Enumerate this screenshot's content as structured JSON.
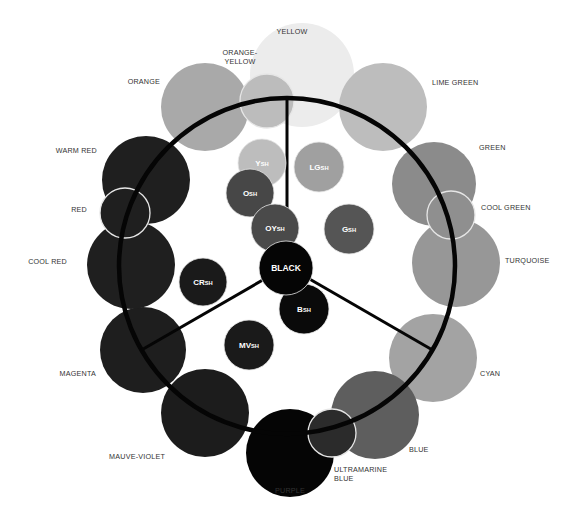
{
  "outer_colors": [
    {
      "id": "yellow",
      "label_lines": [
        "YELLOW"
      ],
      "fill": "#ececec",
      "outlined": false
    },
    {
      "id": "lime-green",
      "label_lines": [
        "LIME GREEN"
      ],
      "fill": "#bdbdbd",
      "outlined": false
    },
    {
      "id": "orange",
      "label_lines": [
        "ORANGE"
      ],
      "fill": "#a9a9a9",
      "outlined": false
    },
    {
      "id": "orange-yellow",
      "label_lines": [
        "ORANGE-",
        "YELLOW"
      ],
      "fill": "#bcbcbc",
      "outlined": true
    },
    {
      "id": "green",
      "label_lines": [
        "GREEN"
      ],
      "fill": "#8b8b8b",
      "outlined": false
    },
    {
      "id": "turquoise",
      "label_lines": [
        "TURQUOISE"
      ],
      "fill": "#979797",
      "outlined": false
    },
    {
      "id": "cool-green",
      "label_lines": [
        "COOL GREEN"
      ],
      "fill": "#8f8f8f",
      "outlined": true
    },
    {
      "id": "cyan",
      "label_lines": [
        "CYAN"
      ],
      "fill": "#a3a3a3",
      "outlined": false
    },
    {
      "id": "blue",
      "label_lines": [
        "BLUE"
      ],
      "fill": "#5e5e5e",
      "outlined": false
    },
    {
      "id": "purple",
      "label_lines": [
        "PURPLE"
      ],
      "fill": "#050505",
      "outlined": false
    },
    {
      "id": "ultramarine-blue",
      "label_lines": [
        "ULTRAMARINE",
        "BLUE"
      ],
      "fill": "#2b2b2b",
      "outlined": true
    },
    {
      "id": "mauve-violet",
      "label_lines": [
        "MAUVE-VIOLET"
      ],
      "fill": "#1c1c1c",
      "outlined": false
    },
    {
      "id": "magenta",
      "label_lines": [
        "MAGENTA"
      ],
      "fill": "#1e1e1e",
      "outlined": false
    },
    {
      "id": "warm-red",
      "label_lines": [
        "WARM RED"
      ],
      "fill": "#1f1f1f",
      "outlined": false
    },
    {
      "id": "cool-red",
      "label_lines": [
        "COOL RED"
      ],
      "fill": "#1f1f1f",
      "outlined": false
    },
    {
      "id": "red",
      "label_lines": [
        "RED"
      ],
      "fill": "#1f1f1f",
      "outlined": true
    }
  ],
  "inner_shades": [
    {
      "id": "ysh",
      "main": "Y",
      "sub": "SH",
      "fill": "#bdbdbd"
    },
    {
      "id": "lgsh",
      "main": "LG",
      "sub": "SH",
      "fill": "#a0a0a0"
    },
    {
      "id": "osh",
      "main": "O",
      "sub": "SH",
      "fill": "#474747"
    },
    {
      "id": "oysh",
      "main": "OY",
      "sub": "SH",
      "fill": "#4a4a4a"
    },
    {
      "id": "gsh",
      "main": "G",
      "sub": "SH",
      "fill": "#555555"
    },
    {
      "id": "crsh",
      "main": "CR",
      "sub": "SH",
      "fill": "#1a1a1a"
    },
    {
      "id": "mvsh",
      "main": "MV",
      "sub": "SH",
      "fill": "#1a1a1a"
    },
    {
      "id": "bsh",
      "main": "B",
      "sub": "SH",
      "fill": "#0a0a0a"
    },
    {
      "id": "black",
      "main": "BLACK",
      "sub": "",
      "fill": "#050505"
    }
  ],
  "colors": {
    "ring": "#050505",
    "outline": "#e6e6e6",
    "label_text": "#333333",
    "inner_text": "#ffffff"
  }
}
